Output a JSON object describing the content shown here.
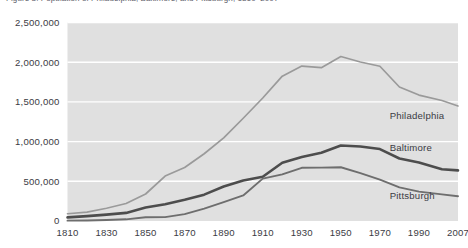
{
  "caption": {
    "text": "Figure 3.  Population of Philadelphia, Baltimore, and Pittsburgh, 1810–2007"
  },
  "colors": {
    "plot_background": "#e0e0e0",
    "gridline": "#ffffff",
    "philadelphia_line": "#9a9a9a",
    "baltimore_line": "#4d4d4d",
    "pittsburgh_line": "#6e6e6e",
    "label_text": "#3b3b44",
    "page_background": "#ffffff"
  },
  "chart_data": {
    "type": "line",
    "title": "",
    "xlabel": "",
    "ylabel": "",
    "grid": true,
    "legend_position": "inline-right",
    "xlim": [
      1810,
      2007
    ],
    "ylim": [
      0,
      2500000
    ],
    "ytick_labels": [
      "0",
      "500,000",
      "1,000,000",
      "1,500,000",
      "2,000,000",
      "2,500,000"
    ],
    "ytick_values": [
      0,
      500000,
      1000000,
      1500000,
      2000000,
      2500000
    ],
    "xtick_labels": [
      "1810",
      "1830",
      "1850",
      "1870",
      "1890",
      "1910",
      "1930",
      "1950",
      "1970",
      "1990",
      "2007"
    ],
    "xtick_values": [
      1810,
      1830,
      1850,
      1870,
      1890,
      1910,
      1930,
      1950,
      1970,
      1990,
      2007
    ],
    "x": [
      1810,
      1820,
      1830,
      1840,
      1850,
      1860,
      1870,
      1880,
      1890,
      1900,
      1910,
      1920,
      1930,
      1940,
      1950,
      1960,
      1970,
      1980,
      1990,
      2000,
      2007
    ],
    "series": [
      {
        "name": "Philadelphia",
        "values": [
          91000,
          112000,
          161000,
          220000,
          340000,
          566000,
          674000,
          847000,
          1047000,
          1294000,
          1549000,
          1824000,
          1951000,
          1931000,
          2072000,
          2003000,
          1949000,
          1688000,
          1586000,
          1518000,
          1449000
        ]
      },
      {
        "name": "Baltimore",
        "values": [
          46000,
          62000,
          80000,
          102000,
          169000,
          212000,
          267000,
          332000,
          434000,
          509000,
          558000,
          734000,
          805000,
          859000,
          950000,
          939000,
          906000,
          787000,
          736000,
          651000,
          637000
        ]
      },
      {
        "name": "Pittsburgh",
        "values": [
          4700,
          7200,
          12500,
          21100,
          46600,
          49200,
          86000,
          156000,
          238000,
          322000,
          534000,
          588000,
          670000,
          672000,
          677000,
          604000,
          520000,
          424000,
          370000,
          335000,
          312000
        ]
      }
    ],
    "annotations": [
      {
        "label": "Philadelphia",
        "x": 1975,
        "y": 1280000
      },
      {
        "label": "Baltimore",
        "x": 1975,
        "y": 885000
      },
      {
        "label": "Pittsburgh",
        "x": 1975,
        "y": 280000
      }
    ]
  }
}
